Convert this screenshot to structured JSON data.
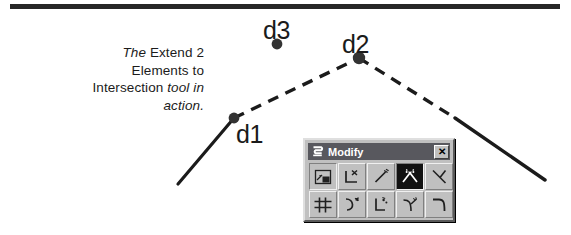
{
  "figure": {
    "caption_lines": [
      [
        {
          "text": "The ",
          "style": "italic"
        },
        {
          "text": "Extend 2",
          "style": "regular"
        }
      ],
      [
        {
          "text": "Elements to",
          "style": "regular"
        }
      ],
      [
        {
          "text": "Intersection ",
          "style": "regular"
        },
        {
          "text": "tool in",
          "style": "italic"
        }
      ],
      [
        {
          "text": "action.",
          "style": "italic"
        }
      ]
    ],
    "caption_plain": "The Extend 2 Elements to Intersection tool in action.",
    "rule_color": "#272727"
  },
  "drawing": {
    "points": [
      {
        "name": "d1",
        "label": "d1",
        "x": 234,
        "y": 118,
        "label_x": 236,
        "label_y": 120
      },
      {
        "name": "d2",
        "label": "d2",
        "x": 359,
        "y": 58,
        "label_x": 342,
        "label_y": 30
      },
      {
        "name": "d3",
        "label": "d3",
        "x": 277,
        "y": 44,
        "label_x": 263,
        "label_y": 16
      }
    ],
    "segments": [
      {
        "name": "left-solid-element",
        "style": "solid",
        "from": [
          178,
          184
        ],
        "to": [
          234,
          118
        ]
      },
      {
        "name": "left-dashed-extension",
        "style": "dashed",
        "from": [
          234,
          118
        ],
        "to": [
          359,
          58
        ]
      },
      {
        "name": "right-dashed-extension",
        "style": "dashed",
        "from": [
          359,
          58
        ],
        "to": [
          455,
          118
        ]
      },
      {
        "name": "right-solid-element",
        "style": "solid",
        "from": [
          455,
          118
        ],
        "to": [
          545,
          180
        ]
      }
    ],
    "line_color": "#1b1b1b",
    "dot_color": "#333333"
  },
  "dialog": {
    "title": "Modify",
    "title_icon": "modify-tool-icon",
    "close_label": "✕",
    "titlebar_color": "#58585e",
    "face_color": "#c0c0c0",
    "rows": [
      [
        {
          "name": "move-element-tool",
          "pressed": false,
          "framed": true
        },
        {
          "name": "delete-part-of-element-tool",
          "pressed": false,
          "framed": false
        },
        {
          "name": "extend-line-tool",
          "pressed": false,
          "framed": false
        },
        {
          "name": "extend-2-elements-to-intersection-tool",
          "pressed": true,
          "framed": false
        },
        {
          "name": "extend-element-to-intersection-tool",
          "pressed": false,
          "framed": false
        }
      ],
      [
        {
          "name": "construct-chamfer-tool",
          "pressed": false,
          "framed": false
        },
        {
          "name": "modify-arc-radius-tool",
          "pressed": false,
          "framed": false
        },
        {
          "name": "modify-arc-angle-tool",
          "pressed": false,
          "framed": false
        },
        {
          "name": "trim-elements-tool",
          "pressed": false,
          "framed": false
        },
        {
          "name": "construct-circular-fillet-tool",
          "pressed": false,
          "framed": false
        }
      ]
    ]
  }
}
